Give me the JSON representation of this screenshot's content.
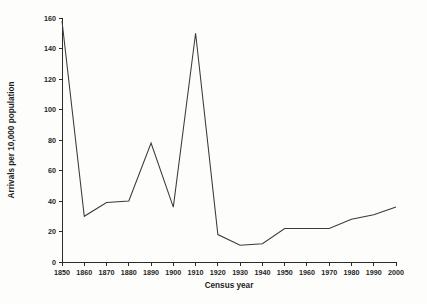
{
  "chart_data": {
    "type": "line",
    "title": "",
    "subtitle": "",
    "xlabel": "Census year",
    "ylabel": "Arrivals per 10,000 population",
    "x": [
      1850,
      1860,
      1870,
      1880,
      1890,
      1900,
      1910,
      1920,
      1930,
      1940,
      1950,
      1960,
      1970,
      1980,
      1990,
      2000
    ],
    "values": [
      158,
      30,
      39,
      40,
      78,
      36,
      150,
      18,
      11,
      12,
      22,
      22,
      22,
      28,
      31,
      36
    ],
    "series": [
      {
        "name": "Arrivals per 10,000 population",
        "values": [
          158,
          30,
          39,
          40,
          78,
          36,
          150,
          18,
          11,
          12,
          22,
          22,
          22,
          28,
          31,
          36
        ]
      }
    ],
    "categories": [
      "1850",
      "1860",
      "1870",
      "1880",
      "1890",
      "1900",
      "1910",
      "1920",
      "1930",
      "1940",
      "1950",
      "1960",
      "1970",
      "1980",
      "1990",
      "2000"
    ],
    "xlim": [
      1850,
      2000
    ],
    "ylim": [
      0,
      160
    ],
    "yticks": [
      0,
      20,
      40,
      60,
      80,
      100,
      120,
      140,
      160
    ],
    "ytick_labels": [
      "0",
      "20",
      "40",
      "60",
      "80",
      "100",
      "120",
      "140",
      "160"
    ],
    "xticks": [
      1850,
      1860,
      1870,
      1880,
      1890,
      1900,
      1910,
      1920,
      1930,
      1940,
      1950,
      1960,
      1970,
      1980,
      1990,
      2000
    ],
    "xtick_labels": [
      "1850",
      "1860",
      "1870",
      "1880",
      "1890",
      "1900",
      "1910",
      "1920",
      "1930",
      "1940",
      "1950",
      "1960",
      "1970",
      "1980",
      "1990",
      "2000"
    ],
    "grid": false,
    "legend": false,
    "legend_position": "none",
    "line_color": "#3a3a3a",
    "axis_color": "#2b2b2b",
    "background_color": "#fdfdfc",
    "annotations": []
  }
}
